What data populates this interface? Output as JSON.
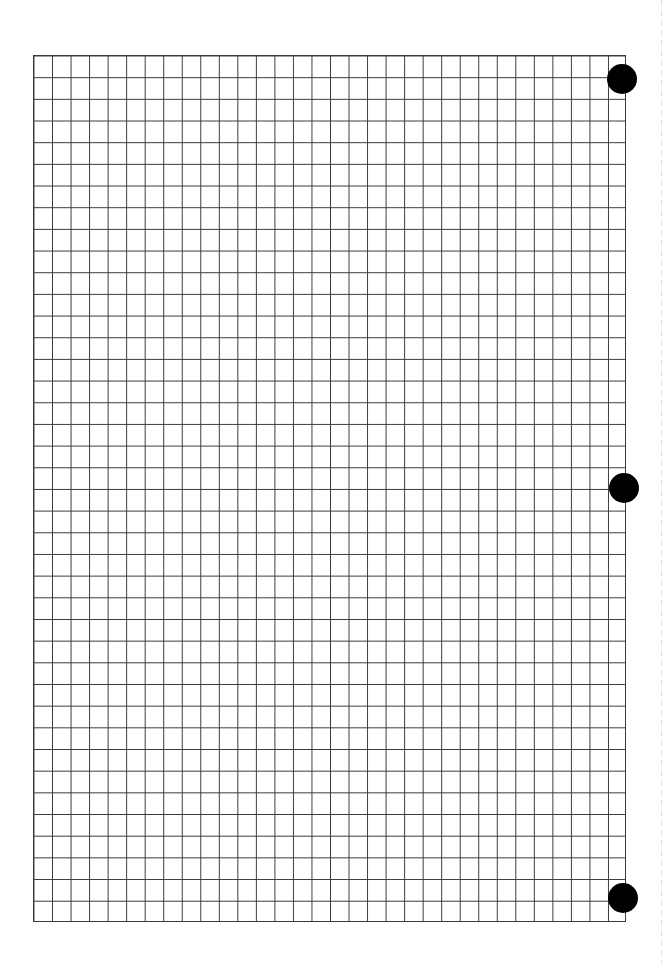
{
  "page": {
    "type": "graph-paper-sheet",
    "background_color": "#ffffff",
    "line_color": "#3a3a3a",
    "hole_color": "#000000"
  },
  "grid": {
    "columns": 32,
    "rows": 40,
    "left": 33,
    "top": 55,
    "width": 593,
    "height": 867
  },
  "punch_holes": [
    {
      "name": "top",
      "cx": 622,
      "cy": 79,
      "r": 15
    },
    {
      "name": "middle",
      "cx": 624,
      "cy": 488,
      "r": 15
    },
    {
      "name": "bottom",
      "cx": 623,
      "cy": 898,
      "r": 15
    }
  ],
  "perforation": {
    "x": 661,
    "style": "dashed",
    "color": "#e2e2e2"
  },
  "label": "Graph paper sheet"
}
